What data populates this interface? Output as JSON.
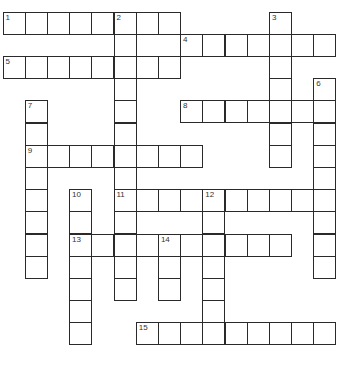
{
  "puzzle": {
    "type": "crossword",
    "rows": 15,
    "cols": 15,
    "cell_size": 22.2,
    "origin": [
      3,
      12
    ],
    "colors": {
      "border": "#2a2a2a",
      "cell": "#ffffff",
      "number": "#333333"
    },
    "entries": [
      {
        "number": "1",
        "direction": "across",
        "row": 0,
        "col": 0,
        "length": 8
      },
      {
        "number": "2",
        "direction": "down",
        "row": 0,
        "col": 5,
        "length": 13
      },
      {
        "number": "3",
        "direction": "down",
        "row": 0,
        "col": 12,
        "length": 7
      },
      {
        "number": "4",
        "direction": "across",
        "row": 1,
        "col": 8,
        "length": 7
      },
      {
        "number": "5",
        "direction": "across",
        "row": 2,
        "col": 0,
        "length": 8
      },
      {
        "number": "6",
        "direction": "down",
        "row": 3,
        "col": 14,
        "length": 9
      },
      {
        "number": "7",
        "direction": "down",
        "row": 4,
        "col": 1,
        "length": 8
      },
      {
        "number": "8",
        "direction": "across",
        "row": 4,
        "col": 8,
        "length": 7
      },
      {
        "number": "9",
        "direction": "across",
        "row": 6,
        "col": 1,
        "length": 8
      },
      {
        "number": "10",
        "direction": "down",
        "row": 8,
        "col": 3,
        "length": 7
      },
      {
        "number": "11",
        "direction": "across",
        "row": 8,
        "col": 5,
        "length": 10
      },
      {
        "number": "12",
        "direction": "down",
        "row": 8,
        "col": 9,
        "length": 7
      },
      {
        "number": "13",
        "direction": "across",
        "row": 10,
        "col": 3,
        "length": 10
      },
      {
        "number": "14",
        "direction": "down",
        "row": 10,
        "col": 7,
        "length": 3
      },
      {
        "number": "15",
        "direction": "across",
        "row": 14,
        "col": 6,
        "length": 9
      }
    ]
  }
}
